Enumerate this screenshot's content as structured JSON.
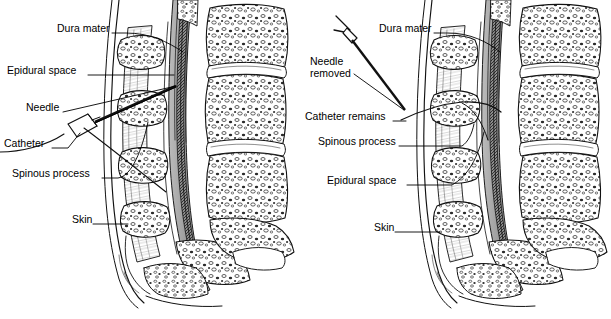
{
  "figure": {
    "background_color": "#ffffff",
    "ink_color": "#000000",
    "tissue_shade_color": "#a8a8a8",
    "panel_count": 2
  },
  "panels": [
    {
      "id": "panel-left",
      "name": "needle-in-place",
      "caption": "",
      "labels": [
        {
          "key": "dura_mater",
          "text": "Dura mater",
          "x": 57,
          "y": 29,
          "align": "left"
        },
        {
          "key": "epidural_space",
          "text": "Epidural space",
          "x": 7,
          "y": 71,
          "align": "left"
        },
        {
          "key": "needle",
          "text": "Needle",
          "x": 26,
          "y": 108,
          "align": "left"
        },
        {
          "key": "catheter",
          "text": "Catheter",
          "x": 4,
          "y": 144,
          "align": "left"
        },
        {
          "key": "spinous_process",
          "text": "Spinous process",
          "x": 12,
          "y": 174,
          "align": "left"
        },
        {
          "key": "skin",
          "text": "Skin",
          "x": 72,
          "y": 220,
          "align": "left"
        }
      ]
    },
    {
      "id": "panel-right",
      "name": "needle-removed-catheter-remains",
      "caption": "",
      "labels": [
        {
          "key": "dura_mater",
          "text": "Dura mater",
          "x": 379,
          "y": 29,
          "align": "left"
        },
        {
          "key": "needle_removed",
          "text": "Needle\nremoved",
          "x": 310,
          "y": 62,
          "align": "left"
        },
        {
          "key": "catheter_remains",
          "text": "Catheter remains",
          "x": 305,
          "y": 117,
          "align": "left"
        },
        {
          "key": "spinous_process",
          "text": "Spinous process",
          "x": 318,
          "y": 142,
          "align": "left"
        },
        {
          "key": "epidural_space",
          "text": "Epidural space",
          "x": 327,
          "y": 181,
          "align": "left"
        },
        {
          "key": "skin",
          "text": "Skin",
          "x": 374,
          "y": 228,
          "align": "left"
        }
      ]
    }
  ],
  "anatomy": {
    "structures": [
      "skin",
      "subcutaneous tissue",
      "supraspinous ligament",
      "interspinous ligament",
      "spinous process",
      "ligamentum flavum",
      "epidural space",
      "dura mater",
      "spinal cord / cauda equina",
      "vertebral body",
      "intervertebral disc",
      "sacrum"
    ]
  },
  "instruments": {
    "left_panel": [
      "epidural needle with hub",
      "epidural catheter"
    ],
    "right_panel": [
      "needle removal forceps",
      "epidural catheter"
    ]
  }
}
